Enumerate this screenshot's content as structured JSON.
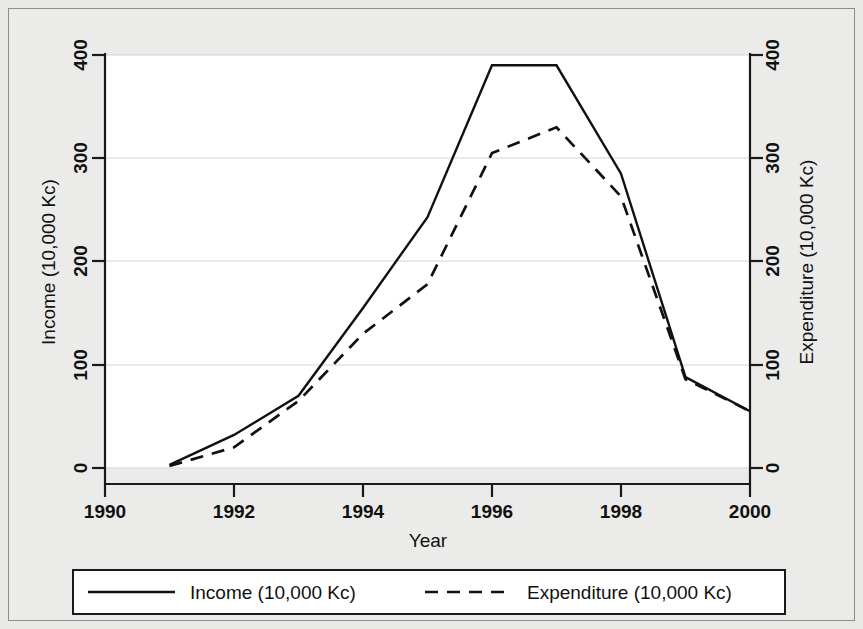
{
  "chart_data": {
    "type": "line",
    "title": "",
    "xlabel": "Year",
    "ylabel": "Income (10,000 Kc)",
    "y2label": "Expenditure (10,000 Kc)",
    "x": [
      1991,
      1992,
      1993,
      1994,
      1995,
      1996,
      1997,
      1998,
      1999,
      2000
    ],
    "xlim": [
      1990,
      2000
    ],
    "ylim": [
      0,
      400
    ],
    "y2lim": [
      0,
      400
    ],
    "xticks": [
      1990,
      1992,
      1994,
      1996,
      1998,
      2000
    ],
    "xtick_labels": [
      "1990",
      "1992",
      "1994",
      "1996",
      "1998",
      "2000"
    ],
    "yticks": [
      0,
      100,
      200,
      300,
      400
    ],
    "ytick_labels": [
      "0",
      "100",
      "200",
      "300",
      "400"
    ],
    "y2ticks": [
      0,
      100,
      200,
      300,
      400
    ],
    "y2tick_labels": [
      "0",
      "100",
      "200",
      "300",
      "400"
    ],
    "grid": "horizontal",
    "legend_position": "below-axes",
    "series": [
      {
        "name": "Income (10,000 Kc)",
        "style": "solid",
        "axis": "left",
        "color": "#111111",
        "values": [
          3,
          32,
          70,
          155,
          243,
          390,
          390,
          285,
          88,
          55
        ]
      },
      {
        "name": "Expenditure (10,000 Kc)",
        "style": "dashed",
        "axis": "right",
        "color": "#111111",
        "values": [
          2,
          20,
          65,
          130,
          178,
          305,
          330,
          263,
          86,
          55
        ]
      }
    ]
  },
  "axes": {
    "left_title": "Income (10,000 Kc)",
    "right_title": "Expenditure (10,000 Kc)",
    "bottom_title": "Year"
  },
  "legend": {
    "items": [
      {
        "label": "Income (10,000 Kc)",
        "style": "solid"
      },
      {
        "label": "Expenditure (10,000 Kc)",
        "style": "dashed"
      }
    ]
  }
}
